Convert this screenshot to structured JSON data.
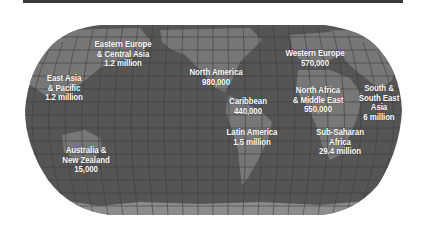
{
  "colors": {
    "ocean": "#555555",
    "land": "#777777",
    "antarctica": "#8c8c8c",
    "grid": "#3e3e3e",
    "topbar": "#3a3a3a",
    "label": "#ffffff"
  },
  "regions": [
    {
      "id": "eastern-europe-central-asia",
      "lines": [
        "Eastern Europe",
        "& Central Asia",
        "1.2 million"
      ],
      "x": 123,
      "y": 40
    },
    {
      "id": "east-asia-pacific",
      "lines": [
        "East Asia",
        "& Pacific",
        "1.2 million"
      ],
      "x": 64,
      "y": 74
    },
    {
      "id": "north-america",
      "lines": [
        "North America",
        "980,000"
      ],
      "x": 216,
      "y": 68
    },
    {
      "id": "caribbean",
      "lines": [
        "Caribbean",
        "440,000"
      ],
      "x": 248,
      "y": 97
    },
    {
      "id": "western-europe",
      "lines": [
        "Western Europe",
        "570,000"
      ],
      "x": 315,
      "y": 49
    },
    {
      "id": "north-africa-middle-east",
      "lines": [
        "North Africa",
        "& Middle East",
        "550,000"
      ],
      "x": 318,
      "y": 86
    },
    {
      "id": "south-southeast-asia",
      "lines": [
        "South &",
        "South East",
        "Asia",
        "6 million"
      ],
      "x": 379,
      "y": 84
    },
    {
      "id": "latin-america",
      "lines": [
        "Latin America",
        "1.5 million"
      ],
      "x": 252,
      "y": 128
    },
    {
      "id": "sub-saharan-africa",
      "lines": [
        "Sub-Saharan",
        "Africa",
        "29.4 million"
      ],
      "x": 340,
      "y": 128
    },
    {
      "id": "australia-new-zealand",
      "lines": [
        "Australia &",
        "New Zealand",
        "15,000"
      ],
      "x": 86,
      "y": 146
    }
  ]
}
